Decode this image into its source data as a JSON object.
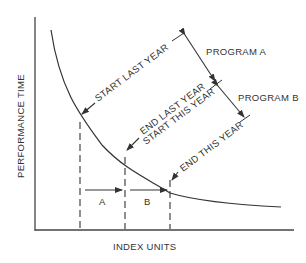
{
  "diagram": {
    "y_axis_label": "PERFORMANCE TIME",
    "x_axis_label": "INDEX UNITS",
    "curve_labels": {
      "start_last_year": "START LAST YEAR",
      "end_last_year": "END LAST YEAR",
      "start_this_year": "START THIS YEAR",
      "end_this_year": "END THIS YEAR"
    },
    "programs": {
      "a": "PROGRAM A",
      "b": "PROGRAM B"
    },
    "intervals": {
      "a": "A",
      "b": "B"
    },
    "colors": {
      "line": "#333333",
      "background": "#ffffff"
    }
  }
}
